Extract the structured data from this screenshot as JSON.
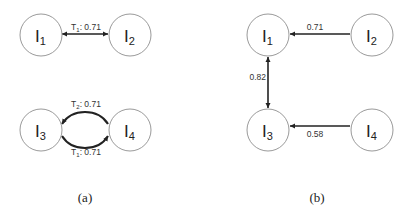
{
  "panels": [
    {
      "caption": "(a)",
      "nodes": [
        {
          "id": "I1",
          "letter": "I",
          "sub": "1"
        },
        {
          "id": "I2",
          "letter": "I",
          "sub": "2"
        },
        {
          "id": "I3",
          "letter": "I",
          "sub": "3"
        },
        {
          "id": "I4",
          "letter": "I",
          "sub": "4"
        }
      ],
      "edges": [
        {
          "from": "I1",
          "to": "I2",
          "bidirectional": true,
          "label_T": "T",
          "label_sub": "1",
          "label_value": ": 0.71"
        },
        {
          "from": "I3",
          "to": "I4",
          "curved": "top",
          "label_T": "T",
          "label_sub": "2",
          "label_value": ": 0.71"
        },
        {
          "from": "I4",
          "to": "I3",
          "curved": "bottom",
          "label_T": "T",
          "label_sub": "1",
          "label_value": ": 0.71"
        }
      ]
    },
    {
      "caption": "(b)",
      "nodes": [
        {
          "id": "I1",
          "letter": "I",
          "sub": "1"
        },
        {
          "id": "I2",
          "letter": "I",
          "sub": "2"
        },
        {
          "id": "I3",
          "letter": "I",
          "sub": "3"
        },
        {
          "id": "I4",
          "letter": "I",
          "sub": "4"
        }
      ],
      "edges": [
        {
          "from": "I2",
          "to": "I1",
          "label": "0.71"
        },
        {
          "from": "I3",
          "to": "I1",
          "bidirectional": true,
          "label": "0.82"
        },
        {
          "from": "I4",
          "to": "I3",
          "label": "0.58"
        }
      ]
    }
  ]
}
